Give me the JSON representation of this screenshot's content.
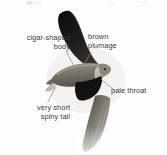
{
  "figure": {
    "background_color": "#fdfdfd",
    "label_color": "#3b3b3b",
    "leader_line_color": "#8a8a8a",
    "plumage_dark_color": "#1a1a1a",
    "plumage_mid_color": "#6d6a64",
    "plumage_light_color": "#b8b5ad",
    "throat_color": "#d8d5cd"
  },
  "labels": {
    "cigar_shaped_body": {
      "line1": "cigar-shaped",
      "line2": "body"
    },
    "brown_plumage": {
      "line1": "brown",
      "line2": "plumage"
    },
    "pale_throat": {
      "line1": "pale throat"
    },
    "very_short_spiny_tail": {
      "line1": "very short",
      "line2": "spiny tail"
    }
  }
}
